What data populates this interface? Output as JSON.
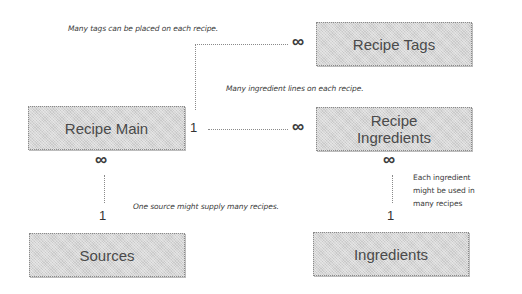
{
  "diagram": {
    "type": "entity-relationship",
    "entities": [
      {
        "id": "recipe_main",
        "label": "Recipe Main"
      },
      {
        "id": "recipe_tags",
        "label": "Recipe Tags"
      },
      {
        "id": "recipe_ingredients",
        "label_line1": "Recipe",
        "label_line2": "Ingredients"
      },
      {
        "id": "sources",
        "label": "Sources"
      },
      {
        "id": "ingredients",
        "label": "Ingredients"
      }
    ],
    "relationships": [
      {
        "from": "recipe_main",
        "to": "recipe_tags",
        "from_card": "1",
        "to_card": "∞",
        "note": "Many tags can be placed on each recipe."
      },
      {
        "from": "recipe_main",
        "to": "recipe_ingredients",
        "from_card": "1",
        "to_card": "∞",
        "note": "Many ingredient lines on each recipe."
      },
      {
        "from": "sources",
        "to": "recipe_main",
        "from_card": "1",
        "to_card": "∞",
        "note": "One source might supply many recipes."
      },
      {
        "from": "ingredients",
        "to": "recipe_ingredients",
        "from_card": "1",
        "to_card": "∞",
        "note_lines": [
          "Each ingredient",
          "might be used in",
          "many recipes"
        ]
      }
    ]
  },
  "labels": {
    "recipe_main": "Recipe Main",
    "recipe_tags": "Recipe Tags",
    "recipe_ingredients_1": "Recipe",
    "recipe_ingredients_2": "Ingredients",
    "sources": "Sources",
    "ingredients": "Ingredients"
  },
  "notes": {
    "tags": "Many tags can be placed on each recipe.",
    "ingredient_lines": "Many ingredient lines on each recipe.",
    "sources": "One source might supply many recipes.",
    "ingredients_1": "Each ingredient",
    "ingredients_2": "might be used in",
    "ingredients_3": "many recipes"
  },
  "cardinality": {
    "one": "1",
    "many": "∞"
  }
}
